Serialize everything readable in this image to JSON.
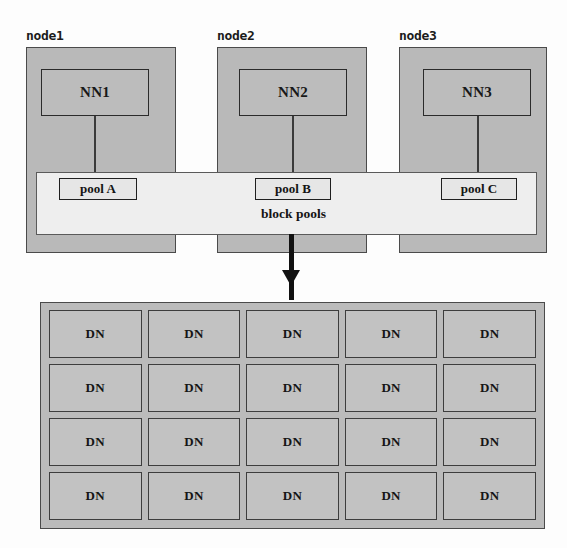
{
  "figure": {
    "background_color": "#fdfdfd",
    "node_fill": "#b9b9b9",
    "pools_bar_fill": "#eeeeee",
    "datanode_fill": "#bbbbbb",
    "stroke_color": "#3a3a3a"
  },
  "nodes": [
    {
      "label": "node1",
      "namenode": "NN1",
      "pool": "pool A"
    },
    {
      "label": "node2",
      "namenode": "NN2",
      "pool": "pool B"
    },
    {
      "label": "node3",
      "namenode": "NN3",
      "pool": "pool C"
    }
  ],
  "pools_bar": {
    "caption": "block pools"
  },
  "datanodes": {
    "cell_label": "DN",
    "rows": 4,
    "columns": 5,
    "cells": [
      [
        "DN",
        "DN",
        "DN",
        "DN",
        "DN"
      ],
      [
        "DN",
        "DN",
        "DN",
        "DN",
        "DN"
      ],
      [
        "DN",
        "DN",
        "DN",
        "DN",
        "DN"
      ],
      [
        "DN",
        "DN",
        "DN",
        "DN",
        "DN"
      ]
    ]
  },
  "arrows": {
    "nn_to_pool": "downward arrow from namenode to its block pool",
    "pools_to_datanodes": "thick downward arrow from block pools to datanode cluster"
  }
}
